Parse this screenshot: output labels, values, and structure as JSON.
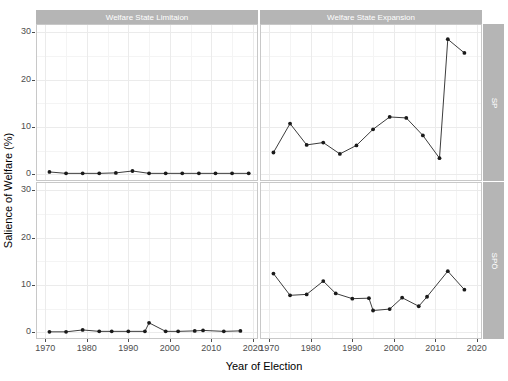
{
  "chart_data": {
    "type": "line",
    "title": "",
    "xlabel": "Year of Election",
    "ylabel": "Salience of Welfare (%)",
    "xlim": [
      1968,
      2021
    ],
    "ylim": [
      -1.2,
      31.5
    ],
    "x_ticks": [
      1970,
      1980,
      1990,
      2000,
      2010,
      2020
    ],
    "y_ticks": [
      0,
      10,
      20,
      30
    ],
    "grid": true,
    "legend_position": "none",
    "facet_columns": [
      "Welfare State Limitaion",
      "Welfare State Expansion"
    ],
    "facet_rows": [
      "SP",
      "SPÖ"
    ],
    "panels": [
      {
        "row_label": "SP",
        "col_label": "Welfare State Limitaion",
        "x": [
          1971,
          1975,
          1979,
          1983,
          1987,
          1991,
          1995,
          1999,
          2003,
          2007,
          2011,
          2015,
          2019
        ],
        "values": [
          0.5,
          0.2,
          0.2,
          0.2,
          0.3,
          0.7,
          0.2,
          0.2,
          0.2,
          0.2,
          0.2,
          0.2,
          0.2
        ]
      },
      {
        "row_label": "SP",
        "col_label": "Welfare State Expansion",
        "x": [
          1971,
          1975,
          1979,
          1983,
          1987,
          1991,
          1995,
          1999,
          2003,
          2007,
          2011,
          2013,
          2017
        ],
        "values": [
          4.6,
          10.7,
          6.2,
          6.7,
          4.3,
          6.1,
          9.5,
          12.1,
          11.9,
          8.2,
          3.4,
          28.5,
          25.6
        ]
      },
      {
        "row_label": "SPÖ",
        "col_label": "Welfare State Limitaion",
        "x": [
          1971,
          1975,
          1979,
          1983,
          1986,
          1990,
          1994,
          1995,
          1999,
          2002,
          2006,
          2008,
          2013,
          2017
        ],
        "values": [
          0.1,
          0.1,
          0.5,
          0.2,
          0.2,
          0.2,
          0.2,
          2.0,
          0.2,
          0.2,
          0.3,
          0.4,
          0.2,
          0.3
        ]
      },
      {
        "row_label": "SPÖ",
        "col_label": "Welfare State Expansion",
        "x": [
          1971,
          1975,
          1979,
          1983,
          1986,
          1990,
          1994,
          1995,
          1999,
          2002,
          2006,
          2008,
          2013,
          2017
        ],
        "values": [
          12.4,
          7.8,
          8.0,
          10.8,
          8.2,
          7.1,
          7.2,
          4.6,
          4.9,
          7.3,
          5.5,
          7.5,
          12.9,
          9.0
        ]
      }
    ]
  },
  "axes": {
    "y_title": "Salience of Welfare (%)",
    "x_title": "Year of Election",
    "y_tick_labels_top": [
      "30",
      "20",
      "10",
      "0"
    ],
    "y_tick_labels_bottom": [
      "30",
      "20",
      "10",
      "0"
    ],
    "x_tick_labels": [
      "1970",
      "1980",
      "1990",
      "2000",
      "2010",
      "2020"
    ]
  },
  "strips": {
    "col_left": "Welfare State Limitaion",
    "col_right": "Welfare State Expansion",
    "row_top": "SP",
    "row_bottom": "SPÖ"
  },
  "colors": {
    "strip_background": "#b5b5b5",
    "strip_text": "#ffffff",
    "panel_border": "#c8c8c8",
    "gridline_major": "#ebebeb",
    "gridline_minor": "#f4f4f4",
    "series_line": "#3d3d3d",
    "series_point": "#1a1a1a",
    "tick_text": "#4d4d4d",
    "background": "#ffffff"
  }
}
